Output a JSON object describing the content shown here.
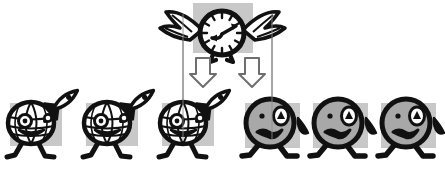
{
  "scene": {
    "title": "Time flies: optimistic world-explorers become anxious faces",
    "width": 445,
    "height": 174,
    "background_color": "#ffffff",
    "ink_color": "#111111",
    "panel_color": "#c8c8c8",
    "face_fill_color": "#a8a8a8",
    "globe_fill_color": "#ffffff",
    "divider_color": "#8c8c8c",
    "arrow_outline_color": "#6e6e6e",
    "arrow_fill_color": "#ffffff"
  },
  "clock": {
    "name": "winged-clock",
    "caption": "winged clock with legs",
    "center_x": 222,
    "center_y": 33,
    "radius": 22,
    "hour_hand_angle_deg": 225,
    "minute_hand_angle_deg": 55,
    "tick_count": 12,
    "panel": {
      "x": 193,
      "y": 3,
      "width": 60,
      "height": 50
    },
    "wings": "two feathered wings, one each side",
    "legs": "two thin kicking legs below"
  },
  "dividers": [
    {
      "name": "divider-left",
      "x": 183,
      "y1": 14,
      "y2": 140
    },
    {
      "name": "divider-right",
      "x": 272,
      "y1": 14,
      "y2": 140
    }
  ],
  "arrows": [
    {
      "name": "down-arrow-left",
      "x": 203,
      "y": 70,
      "direction": "down",
      "style": "hollow-outline"
    },
    {
      "name": "down-arrow-right",
      "x": 252,
      "y": 70,
      "direction": "down",
      "style": "hollow-outline"
    }
  ],
  "figures": [
    {
      "id": 1,
      "name": "globe-head-figure",
      "mood": "optimistic",
      "head": "globe",
      "accessory": "rocket",
      "expression": "smiling",
      "x": 34,
      "panel": {
        "x": 10,
        "y": 101,
        "width": 52,
        "height": 43
      }
    },
    {
      "id": 2,
      "name": "globe-head-figure",
      "mood": "optimistic",
      "head": "globe",
      "accessory": "rocket",
      "expression": "smiling",
      "x": 110,
      "panel": {
        "x": 86,
        "y": 101,
        "width": 52,
        "height": 43
      }
    },
    {
      "id": 3,
      "name": "globe-head-figure",
      "mood": "optimistic",
      "head": "globe",
      "accessory": "rocket",
      "expression": "smiling",
      "x": 186,
      "panel": {
        "x": 162,
        "y": 101,
        "width": 52,
        "height": 43
      }
    },
    {
      "id": 4,
      "name": "worried-face-figure",
      "mood": "anxious",
      "head": "plain",
      "accessory": "sweat-drop",
      "expression": "worried-frown",
      "x": 272,
      "panel": {
        "x": 245,
        "y": 101,
        "width": 55,
        "height": 45
      }
    },
    {
      "id": 5,
      "name": "worried-face-figure",
      "mood": "anxious",
      "head": "plain",
      "accessory": "sweat-drop",
      "expression": "worried-frown",
      "x": 340,
      "panel": {
        "x": 313,
        "y": 101,
        "width": 55,
        "height": 45
      }
    },
    {
      "id": 6,
      "name": "worried-face-figure",
      "mood": "anxious",
      "head": "plain",
      "accessory": "sweat-drop",
      "expression": "worried-frown",
      "x": 408,
      "panel": {
        "x": 381,
        "y": 101,
        "width": 55,
        "height": 45
      }
    }
  ]
}
